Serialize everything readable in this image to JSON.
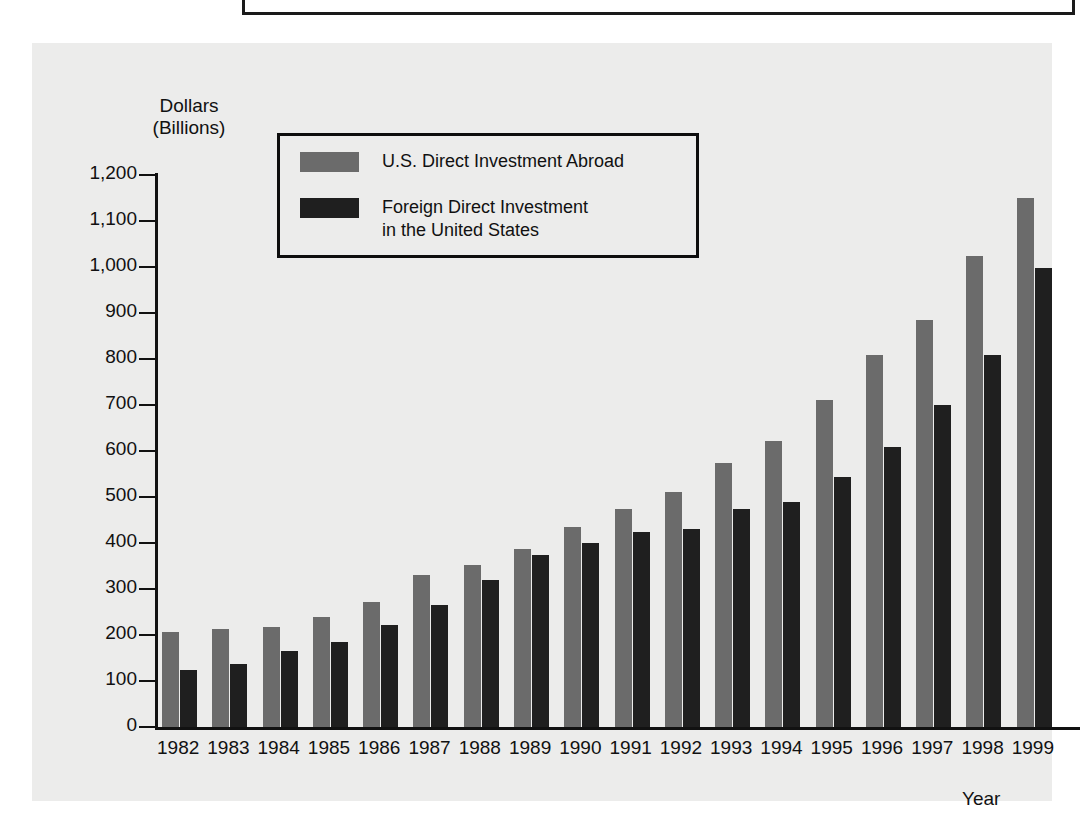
{
  "chart_data": {
    "type": "bar",
    "title": "",
    "ylabel": "Dollars (Billions)",
    "ylabel_line1": "Dollars",
    "ylabel_line2": "(Billions)",
    "xlabel": "Year",
    "ylim": [
      0,
      1200
    ],
    "ytick_step": 100,
    "grid": false,
    "legend_position": "top-left inside plot",
    "ytick_labels": [
      "1,200",
      "1,100",
      "1,000",
      "900",
      "800",
      "700",
      "600",
      "500",
      "400",
      "300",
      "200",
      "100",
      "0"
    ],
    "ytick_values": [
      1200,
      1100,
      1000,
      900,
      800,
      700,
      600,
      500,
      400,
      300,
      200,
      100,
      0
    ],
    "categories": [
      "1982",
      "1983",
      "1984",
      "1985",
      "1986",
      "1987",
      "1988",
      "1989",
      "1990",
      "1991",
      "1992",
      "1993",
      "1994",
      "1995",
      "1996",
      "1997",
      "1998",
      "1999"
    ],
    "series": [
      {
        "name": "U.S. Direct Investment Abroad",
        "color": "#6b6b6b",
        "values": [
          207,
          212,
          218,
          239,
          271,
          330,
          352,
          388,
          435,
          473,
          510,
          573,
          621,
          711,
          808,
          884,
          1025,
          1150
        ]
      },
      {
        "name": "Foreign Direct Investment in the United States",
        "color": "#1f1f1f",
        "values": [
          125,
          138,
          165,
          185,
          221,
          265,
          319,
          374,
          401,
          423,
          430,
          473,
          489,
          543,
          609,
          701,
          808,
          998
        ]
      }
    ]
  },
  "legend": {
    "items": [
      {
        "label": "U.S. Direct Investment Abroad",
        "color": "#6b6b6b",
        "swatch_name": "legend-swatch-gray"
      },
      {
        "label": "Foreign Direct Investment\nin the United States",
        "color": "#1f1f1f",
        "swatch_name": "legend-swatch-black"
      }
    ]
  },
  "colors": {
    "background": "#ffffff",
    "panel": "#ececeb",
    "axis": "#111111",
    "series_gray": "#6b6b6b",
    "series_black": "#1f1f1f"
  }
}
